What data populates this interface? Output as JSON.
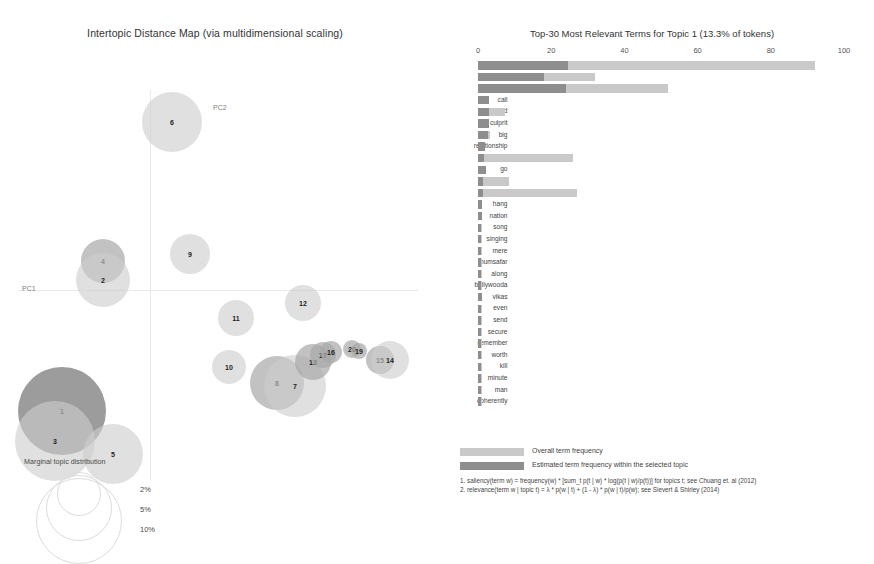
{
  "left_panel": {
    "title": "Intertopic Distance Map (via multidimensional scaling)",
    "axis": {
      "x_label": "PC1",
      "y_label": "PC2"
    },
    "marginal_legend": {
      "label": "Marginal topic distribution",
      "sizes": [
        "2%",
        "5%",
        "10%"
      ]
    },
    "topics": [
      {
        "id": "6",
        "x": 172,
        "y": 80,
        "r": 30,
        "shade": "pale"
      },
      {
        "id": "4",
        "x": 103,
        "y": 219,
        "r": 22,
        "shade": "mid"
      },
      {
        "id": "2",
        "x": 103,
        "y": 238,
        "r": 27,
        "shade": "pale"
      },
      {
        "id": "9",
        "x": 190,
        "y": 212,
        "r": 20,
        "shade": "pale"
      },
      {
        "id": "11",
        "x": 236,
        "y": 276,
        "r": 18,
        "shade": "pale"
      },
      {
        "id": "12",
        "x": 303,
        "y": 261,
        "r": 18,
        "shade": "pale"
      },
      {
        "id": "10",
        "x": 229,
        "y": 325,
        "r": 17,
        "shade": "pale"
      },
      {
        "id": "8",
        "x": 277,
        "y": 341,
        "r": 27,
        "shade": "mid"
      },
      {
        "id": "7",
        "x": 295,
        "y": 344,
        "r": 31,
        "shade": "pale"
      },
      {
        "id": "13",
        "x": 313,
        "y": 320,
        "r": 18,
        "shade": "mid"
      },
      {
        "id": "17",
        "x": 323,
        "y": 313,
        "r": 13,
        "shade": "mid"
      },
      {
        "id": "16",
        "x": 331,
        "y": 310,
        "r": 11,
        "shade": "mid"
      },
      {
        "id": "20",
        "x": 352,
        "y": 307,
        "r": 9,
        "shade": "mid"
      },
      {
        "id": "19",
        "x": 359,
        "y": 309,
        "r": 8,
        "shade": "mid"
      },
      {
        "id": "15",
        "x": 380,
        "y": 318,
        "r": 14,
        "shade": "mid"
      },
      {
        "id": "14",
        "x": 390,
        "y": 318,
        "r": 19,
        "shade": "pale"
      },
      {
        "id": "1",
        "x": 62,
        "y": 369,
        "r": 44,
        "shade": "dark"
      },
      {
        "id": "3",
        "x": 55,
        "y": 399,
        "r": 40,
        "shade": "pale"
      },
      {
        "id": "5",
        "x": 113,
        "y": 412,
        "r": 30,
        "shade": "pale"
      }
    ]
  },
  "chart_data": {
    "type": "bar",
    "title": "Top-30 Most Relevant Terms for Topic 1 (13.3% of tokens)",
    "xlabel": "",
    "ylabel": "",
    "xlim": [
      0,
      100
    ],
    "ticks": [
      0,
      20,
      40,
      60,
      80,
      100
    ],
    "grid": false,
    "legend_position": "bottom",
    "categories": [
      "sushant",
      "singh",
      "rajput",
      "call",
      "hand",
      "culprit",
      "big",
      "relationship",
      "bihar",
      "go",
      "murder",
      "death",
      "hang",
      "nation",
      "song",
      "singing",
      "mere",
      "humsafar",
      "along",
      "bollywooda",
      "vikas",
      "even",
      "send",
      "secure",
      "remember",
      "worth",
      "kill",
      "minute",
      "man",
      "coherently"
    ],
    "series": [
      {
        "name": "Overall term frequency",
        "values": [
          92,
          32,
          52,
          3.1,
          7.5,
          3.0,
          3.2,
          2.0,
          26,
          2.3,
          8.4,
          27,
          1.1,
          1.1,
          1.0,
          1.0,
          1.0,
          1.0,
          1.0,
          1.0,
          1.2,
          1.0,
          1.0,
          1.0,
          1.0,
          1.0,
          1.0,
          1.0,
          1.0,
          1.0
        ]
      },
      {
        "name": "Estimated term frequency within the selected topic",
        "values": [
          24.5,
          18,
          24,
          3.1,
          3.0,
          3.0,
          2.6,
          1.8,
          1.6,
          2.3,
          1.5,
          1.5,
          1.0,
          1.0,
          0.9,
          0.9,
          0.9,
          0.9,
          0.9,
          0.9,
          1.1,
          0.9,
          0.9,
          0.9,
          0.9,
          0.9,
          0.9,
          0.9,
          0.9,
          0.9
        ]
      }
    ]
  },
  "legend": {
    "overall": "Overall term frequency",
    "estimated": "Estimated term frequency within the selected topic"
  },
  "footnotes": [
    "1. saliency(term w) = frequency(w) * [sum_t p(t | w) * log(p(t | w)/p(t))] for topics t; see Chuang et. al (2012)",
    "2. relevance(term w | topic t) = λ * p(w | t) + (1 - λ) * p(w | t)/p(w); see Sievert & Shirley (2014)"
  ],
  "colors": {
    "bar_overall": "#c9c9c9",
    "bar_estimated": "#8e8e8e",
    "text": "#3a3a3a"
  }
}
